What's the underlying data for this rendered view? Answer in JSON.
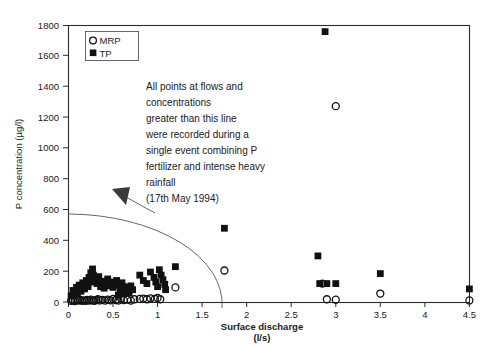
{
  "figure": {
    "background_color": "#ffffff",
    "frame_color": "#2b2b2b",
    "marker_color": "#111111"
  },
  "legend": {
    "position": "top-left-inside",
    "entries": [
      {
        "label": "MRP",
        "marker": "open-circle"
      },
      {
        "label": "TP",
        "marker": "filled-square"
      }
    ]
  },
  "annotation": {
    "lines": [
      "All points at flows and",
      "concentrations",
      "greater than this line",
      "were recorded during a",
      "single event combining P",
      "fertilizer and intense heavy",
      "rainfall",
      "(17th May 1994)"
    ],
    "arrow": "points-up-left-to-threshold-curve"
  },
  "chart_data": {
    "type": "scatter",
    "title": "",
    "xlabel": "Surface discharge",
    "xlabel_units": "(l/s)",
    "ylabel": "P concentration (µg/l)",
    "xlim": [
      0,
      4.5
    ],
    "ylim": [
      0,
      1800
    ],
    "xticks": [
      0,
      0.5,
      1,
      1.5,
      2,
      2.5,
      3,
      3.5,
      4,
      4.5
    ],
    "xtick_labels": [
      "0",
      "0.5",
      "1",
      "1.5",
      "2",
      "2.5",
      "3",
      "3.5",
      "4",
      "4.5"
    ],
    "yticks": [
      0,
      200,
      400,
      600,
      800,
      1000,
      1200,
      1400,
      1600,
      1800
    ],
    "ytick_labels": [
      "0",
      "200",
      "400",
      "600",
      "800",
      "1000",
      "1200",
      "1400",
      "1600",
      "1800"
    ],
    "grid": false,
    "legend_position": "upper left",
    "threshold_curve": {
      "description": "quarter-ellipse threshold line; points beyond it were recorded during a single 17th May 1994 event",
      "y_intercept": 570,
      "x_intercept": 1.75
    },
    "series": [
      {
        "name": "MRP",
        "marker": "open-circle",
        "points": [
          [
            0.03,
            8
          ],
          [
            0.05,
            10
          ],
          [
            0.07,
            6
          ],
          [
            0.09,
            12
          ],
          [
            0.11,
            9
          ],
          [
            0.13,
            14
          ],
          [
            0.15,
            8
          ],
          [
            0.17,
            11
          ],
          [
            0.19,
            7
          ],
          [
            0.21,
            13
          ],
          [
            0.23,
            9
          ],
          [
            0.25,
            15
          ],
          [
            0.27,
            10
          ],
          [
            0.29,
            8
          ],
          [
            0.31,
            12
          ],
          [
            0.33,
            18
          ],
          [
            0.35,
            10
          ],
          [
            0.38,
            14
          ],
          [
            0.41,
            9
          ],
          [
            0.44,
            16
          ],
          [
            0.47,
            11
          ],
          [
            0.5,
            20
          ],
          [
            0.53,
            13
          ],
          [
            0.56,
            10
          ],
          [
            0.59,
            22
          ],
          [
            0.62,
            12
          ],
          [
            0.66,
            15
          ],
          [
            0.7,
            9
          ],
          [
            0.74,
            18
          ],
          [
            0.8,
            20
          ],
          [
            0.84,
            22
          ],
          [
            0.88,
            18
          ],
          [
            0.92,
            24
          ],
          [
            0.97,
            20
          ],
          [
            1.0,
            26
          ],
          [
            1.03,
            18
          ],
          [
            1.2,
            95
          ],
          [
            1.75,
            205
          ],
          [
            2.85,
            120
          ],
          [
            2.9,
            18
          ],
          [
            3.0,
            1275
          ],
          [
            3.0,
            15
          ],
          [
            3.5,
            55
          ],
          [
            4.5,
            10
          ]
        ]
      },
      {
        "name": "TP",
        "marker": "filled-square",
        "points": [
          [
            0.03,
            40
          ],
          [
            0.05,
            75
          ],
          [
            0.07,
            55
          ],
          [
            0.09,
            95
          ],
          [
            0.1,
            60
          ],
          [
            0.12,
            110
          ],
          [
            0.14,
            70
          ],
          [
            0.16,
            125
          ],
          [
            0.18,
            85
          ],
          [
            0.2,
            140
          ],
          [
            0.22,
            100
          ],
          [
            0.23,
            160
          ],
          [
            0.25,
            190
          ],
          [
            0.26,
            130
          ],
          [
            0.27,
            215
          ],
          [
            0.28,
            175
          ],
          [
            0.3,
            145
          ],
          [
            0.32,
            120
          ],
          [
            0.34,
            165
          ],
          [
            0.36,
            100
          ],
          [
            0.38,
            135
          ],
          [
            0.4,
            90
          ],
          [
            0.42,
            115
          ],
          [
            0.44,
            150
          ],
          [
            0.46,
            105
          ],
          [
            0.48,
            130
          ],
          [
            0.5,
            95
          ],
          [
            0.52,
            120
          ],
          [
            0.54,
            140
          ],
          [
            0.56,
            110
          ],
          [
            0.58,
            85
          ],
          [
            0.6,
            125
          ],
          [
            0.62,
            100
          ],
          [
            0.64,
            70
          ],
          [
            0.66,
            95
          ],
          [
            0.68,
            60
          ],
          [
            0.7,
            105
          ],
          [
            0.72,
            80
          ],
          [
            0.62,
            55
          ],
          [
            0.56,
            45
          ],
          [
            0.8,
            175
          ],
          [
            0.84,
            140
          ],
          [
            0.88,
            120
          ],
          [
            0.92,
            195
          ],
          [
            0.96,
            160
          ],
          [
            0.98,
            130
          ],
          [
            1.0,
            100
          ],
          [
            1.02,
            210
          ],
          [
            1.04,
            175
          ],
          [
            1.06,
            145
          ],
          [
            1.08,
            115
          ],
          [
            1.09,
            80
          ],
          [
            1.2,
            230
          ],
          [
            1.75,
            480
          ],
          [
            2.8,
            300
          ],
          [
            2.82,
            120
          ],
          [
            2.88,
            1760
          ],
          [
            2.9,
            120
          ],
          [
            3.0,
            120
          ],
          [
            3.5,
            185
          ],
          [
            4.5,
            85
          ]
        ]
      }
    ]
  }
}
